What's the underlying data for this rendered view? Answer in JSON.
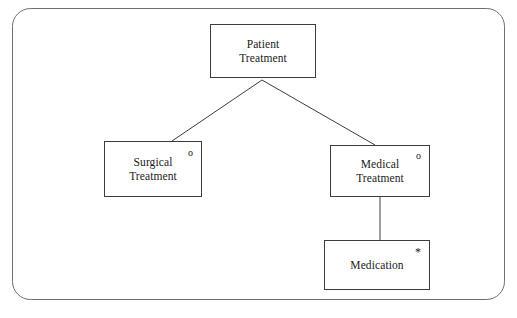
{
  "diagram": {
    "type": "generalization-hierarchy",
    "frame": {
      "name": "rounded-frame",
      "stroke_color": "#6e6e6e",
      "fill_color": "#ffffff",
      "corner_radius": 18
    },
    "stroke_color": "#3c3c3c",
    "text_color": "#1a1a1a",
    "nodes": [
      {
        "id": "patient-treatment",
        "lines": [
          "Patient",
          "Treatment"
        ],
        "marker": "",
        "x": 210,
        "y": 24,
        "w": 106,
        "h": 54
      },
      {
        "id": "surgical-treatment",
        "lines": [
          "Surgical",
          "Treatment"
        ],
        "marker": "o",
        "x": 104,
        "y": 141,
        "w": 98,
        "h": 56
      },
      {
        "id": "medical-treatment",
        "lines": [
          "Medical",
          "Treatment"
        ],
        "marker": "o",
        "x": 330,
        "y": 145,
        "w": 100,
        "h": 52
      },
      {
        "id": "medication",
        "lines": [
          "Medication"
        ],
        "marker": "*",
        "x": 324,
        "y": 240,
        "w": 106,
        "h": 50
      }
    ],
    "connectors": [
      {
        "id": "patient-to-surgical",
        "from": "patient-treatment",
        "to": "surgical-treatment",
        "kind": "diagonal",
        "points": "262,80 172,141"
      },
      {
        "id": "patient-to-medical",
        "from": "patient-treatment",
        "to": "medical-treatment",
        "kind": "diagonal",
        "points": "262,80 375,145"
      },
      {
        "id": "medical-to-medication",
        "from": "medical-treatment",
        "to": "medication",
        "kind": "vertical",
        "points": "380,197 380,240"
      }
    ]
  }
}
